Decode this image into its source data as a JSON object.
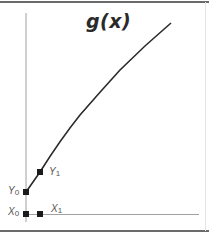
{
  "diagram": {
    "title": "g(x)",
    "labels": {
      "y0": {
        "main": "Y",
        "sub": "0"
      },
      "y1": {
        "main": "Y",
        "sub": "1"
      },
      "x0": {
        "main": "X",
        "sub": "0"
      },
      "x1": {
        "main": "X",
        "sub": "1"
      }
    },
    "colors": {
      "axis": "#9a9a9a",
      "curve": "#2a2a2a",
      "marker": "#1a1a1a",
      "frame": "#6a6a6a"
    },
    "curve_description": "concave increasing curve starting at Y0 on the y-axis, passing Y1, rising to top right"
  }
}
